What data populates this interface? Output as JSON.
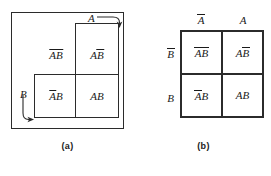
{
  "figure": {
    "panels": [
      {
        "id": "a",
        "caption": "(a)",
        "kind": "venn-rectangle-diagram",
        "variable_arrows": [
          {
            "name": "arrow-label-A",
            "label": "A",
            "points_to": "top-right of set A rectangle"
          },
          {
            "name": "arrow-label-B",
            "label": "B",
            "points_to": "bottom-left of set B rectangle"
          }
        ],
        "regions": [
          {
            "name": "region-not-a-not-b",
            "label_plain": "AB",
            "overbars": "both",
            "position": "upper-left"
          },
          {
            "name": "region-a-not-b",
            "label_plain": "AB",
            "overbars": "second",
            "position": "upper-right"
          },
          {
            "name": "region-not-a-b",
            "label_plain": "AB",
            "overbars": "first",
            "position": "lower-left"
          },
          {
            "name": "region-a-b",
            "label_plain": "AB",
            "overbars": "none",
            "position": "lower-right"
          }
        ]
      },
      {
        "id": "b",
        "caption": "(b)",
        "kind": "karnaugh-map",
        "column_headers": [
          {
            "name": "column-header-not-a",
            "letter": "A",
            "bar": true
          },
          {
            "name": "column-header-a",
            "letter": "A",
            "bar": false
          }
        ],
        "row_headers": [
          {
            "name": "row-header-not-b",
            "letter": "B",
            "bar": true
          },
          {
            "name": "row-header-b",
            "letter": "B",
            "bar": false
          }
        ],
        "cells": [
          {
            "name": "kmap-cell-not-a-not-b",
            "row": 0,
            "col": 0,
            "first": "A",
            "first_bar": true,
            "second": "B",
            "second_bar": true
          },
          {
            "name": "kmap-cell-a-not-b",
            "row": 0,
            "col": 1,
            "first": "A",
            "first_bar": false,
            "second": "B",
            "second_bar": true
          },
          {
            "name": "kmap-cell-not-a-b",
            "row": 1,
            "col": 0,
            "first": "A",
            "first_bar": true,
            "second": "B",
            "second_bar": false
          },
          {
            "name": "kmap-cell-a-b",
            "row": 1,
            "col": 1,
            "first": "A",
            "first_bar": false,
            "second": "B",
            "second_bar": false
          }
        ]
      }
    ]
  },
  "labels": {
    "A": "A",
    "B": "B",
    "caption_a": "(a)",
    "caption_b": "(b)"
  },
  "colors": {
    "stroke": "#2b2b2b",
    "text": "#1a1a1a",
    "background": "#ffffff"
  }
}
